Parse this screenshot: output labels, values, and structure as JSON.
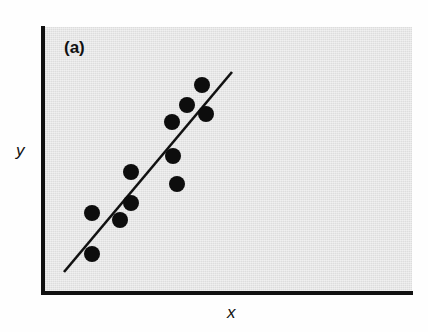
{
  "figure": {
    "panel_label": "(a)",
    "x_axis_label": "x",
    "y_axis_label": "y",
    "background_color": "#dddddd",
    "axis_color": "#111111",
    "point_color": "#0d0d0d",
    "line_color": "#111111"
  },
  "chart_data": {
    "type": "scatter",
    "title": "(a)",
    "xlabel": "x",
    "ylabel": "y",
    "grid": false,
    "legend": false,
    "axis_ticks": false,
    "xlim": [
      0,
      1
    ],
    "ylim": [
      0,
      1
    ],
    "points_px": [
      {
        "x": 92,
        "y": 254
      },
      {
        "x": 92,
        "y": 213
      },
      {
        "x": 120,
        "y": 220
      },
      {
        "x": 131,
        "y": 203
      },
      {
        "x": 131,
        "y": 172
      },
      {
        "x": 173,
        "y": 156
      },
      {
        "x": 172,
        "y": 122
      },
      {
        "x": 187,
        "y": 105
      },
      {
        "x": 202,
        "y": 85
      },
      {
        "x": 206,
        "y": 114
      },
      {
        "x": 177,
        "y": 184
      }
    ],
    "x": [
      0.15,
      0.15,
      0.24,
      0.27,
      0.27,
      0.4,
      0.4,
      0.45,
      0.5,
      0.51,
      0.41
    ],
    "y": [
      0.15,
      0.3,
      0.27,
      0.34,
      0.45,
      0.51,
      0.64,
      0.7,
      0.78,
      0.67,
      0.41
    ],
    "trend_line_px": {
      "x1": 64,
      "y1": 272,
      "x2": 232,
      "y2": 72
    },
    "trend_line": {
      "x1": 0.06,
      "y1": 0.08,
      "x2": 0.51,
      "y2": 0.83
    },
    "n_points": 11,
    "point_radius_px": 8
  }
}
